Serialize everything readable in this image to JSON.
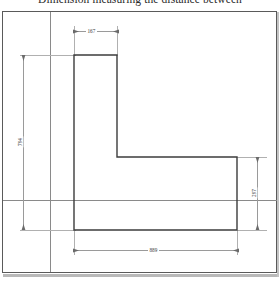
{
  "title": "Dimension measuring the distance between",
  "drawing": {
    "name": "l-shaped-profile",
    "type": "engineering-dimension-drawing",
    "units": "mm",
    "dimensions": [
      {
        "id": "top-width",
        "value": "167",
        "orientation": "horizontal",
        "position": "top"
      },
      {
        "id": "left-height",
        "value": "794",
        "orientation": "vertical",
        "position": "left"
      },
      {
        "id": "right-height",
        "value": "297",
        "orientation": "vertical",
        "position": "right"
      },
      {
        "id": "bottom-width",
        "value": "889",
        "orientation": "horizontal",
        "position": "bottom"
      }
    ],
    "colors": {
      "outline": "#3c3c3c",
      "frame": "#5a5a5a",
      "dimension": "#9a9a9a",
      "extension": "#b0b0b0",
      "construction": "#8a8a8a",
      "background": "#ffffff",
      "text": "#3a3a3a"
    }
  }
}
